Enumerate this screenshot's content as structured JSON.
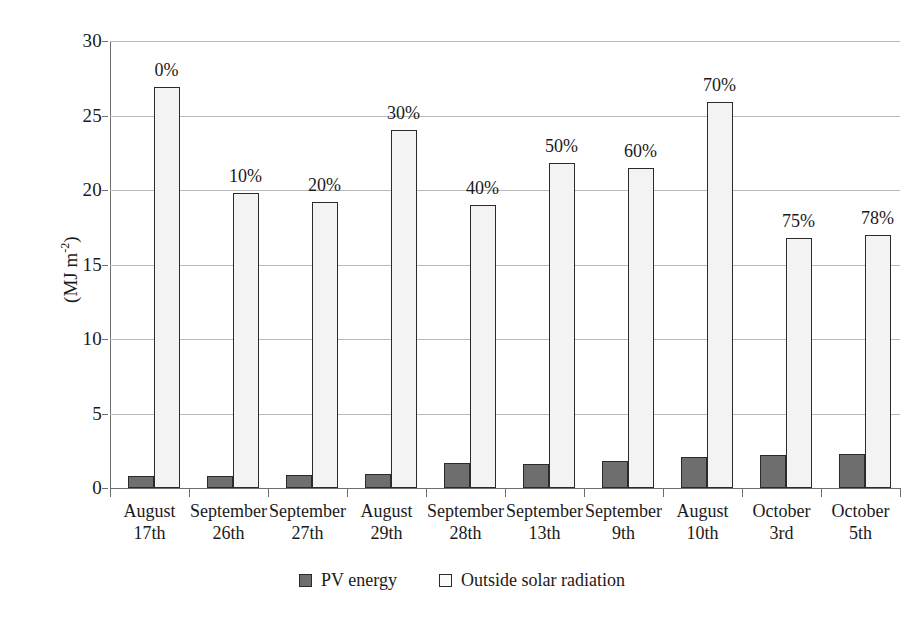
{
  "chart_data": {
    "type": "bar",
    "title": "",
    "subtitle": "",
    "xlabel": "",
    "ylabel": "(MJ m-2)",
    "ylabel_base": "(MJ m",
    "ylabel_exponent": "-2",
    "ylabel_tail": ")",
    "ylim": [
      0,
      30
    ],
    "ytick_values": [
      0,
      5,
      10,
      15,
      20,
      25,
      30
    ],
    "ytick_labels": [
      "0",
      "5",
      "10",
      "15",
      "20",
      "25",
      "30"
    ],
    "grid": "horizontal",
    "legend_position": "bottom-center",
    "categories": [
      "August 17th",
      "September 26th",
      "September 27th",
      "August 29th",
      "September 28th",
      "September 13th",
      "September 9th",
      "August 10th",
      "October 3rd",
      "October 5th"
    ],
    "category_lines": [
      [
        "August",
        "17th"
      ],
      [
        "September",
        "26th"
      ],
      [
        "September",
        "27th"
      ],
      [
        "August",
        "29th"
      ],
      [
        "September",
        "28th"
      ],
      [
        "September",
        "13th"
      ],
      [
        "September",
        "9th"
      ],
      [
        "August",
        "10th"
      ],
      [
        "October",
        "3rd"
      ],
      [
        "October",
        "5th"
      ]
    ],
    "annotations": [
      "0%",
      "10%",
      "20%",
      "30%",
      "40%",
      "50%",
      "60%",
      "70%",
      "75%",
      "78%"
    ],
    "series": [
      {
        "name": "PV energy",
        "color": "#6e6e6e",
        "values": [
          0.8,
          0.8,
          0.85,
          0.95,
          1.65,
          1.6,
          1.8,
          2.1,
          2.2,
          2.3
        ]
      },
      {
        "name": "Outside solar radiation",
        "color": "#f3f3f3",
        "values": [
          26.9,
          19.8,
          19.2,
          24.0,
          19.0,
          21.8,
          21.5,
          25.9,
          16.8,
          17.0
        ]
      }
    ]
  },
  "legend": {
    "items": [
      {
        "label": "PV energy",
        "swatch": "filled-gray-square"
      },
      {
        "label": "Outside solar radiation",
        "swatch": "outlined-white-square"
      }
    ]
  },
  "colors": {
    "pv_fill": "#6e6e6e",
    "osr_fill": "#f3f3f3",
    "bar_stroke": "#2b2b2b",
    "gridline": "#b9b9b9",
    "axis": "#6e6e6e",
    "text": "#1a1a1a",
    "background": "#ffffff"
  }
}
